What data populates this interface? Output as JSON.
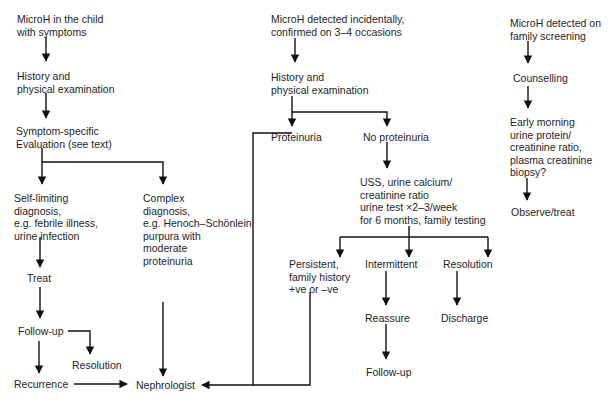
{
  "diagram": {
    "type": "flowchart",
    "columns": {
      "symptomatic": {
        "start": "MicroH in the child\nwith symptoms",
        "history": "History and\nphysical examination",
        "evaluation": "Symptom-specific\nEvaluation (see text)",
        "self_limiting": "Self-limiting\ndiagnosis,\ne.g. febrile illness,\nurine infection",
        "complex": "Complex\ndiagnosis,\ne.g. Henoch–Schönlein\npurpura with\nmoderate\nproteinuria",
        "treat": "Treat",
        "follow_up": "Follow-up",
        "resolution": "Resolution",
        "recurrence": "Recurrence"
      },
      "incidental": {
        "start": "MicroH detected incidentally,\nconfirmed on 3–4 occasions",
        "history": "History and\nphysical examination",
        "proteinuria": "Proteinuria",
        "no_proteinuria": "No proteinuria",
        "tests": "USS, urine calcium/\ncreatinine ratio\nurine test ×2–3/week\nfor 6 months, family testing",
        "persistent": "Persistent,\nfamily history\n+ve or –ve",
        "intermittent": "Intermittent",
        "resolution": "Resolution",
        "reassure": "Reassure",
        "discharge": "Discharge",
        "follow_up": "Follow-up"
      },
      "family": {
        "start": "MicroH detected on\nfamily screening",
        "counselling": "Counselling",
        "tests": "Early morning\nurine protein/\ncreatinine ratio,\nplasma creatinine\nbiopsy?",
        "observe": "Observe/treat"
      }
    },
    "endpoint": "Nephrologist",
    "edges": [
      [
        "symptomatic.start",
        "symptomatic.history"
      ],
      [
        "symptomatic.history",
        "symptomatic.evaluation"
      ],
      [
        "symptomatic.evaluation",
        "symptomatic.self_limiting"
      ],
      [
        "symptomatic.evaluation",
        "symptomatic.complex"
      ],
      [
        "symptomatic.self_limiting",
        "symptomatic.treat"
      ],
      [
        "symptomatic.treat",
        "symptomatic.follow_up"
      ],
      [
        "symptomatic.follow_up",
        "symptomatic.resolution"
      ],
      [
        "symptomatic.follow_up",
        "symptomatic.recurrence"
      ],
      [
        "symptomatic.recurrence",
        "endpoint"
      ],
      [
        "symptomatic.complex",
        "endpoint"
      ],
      [
        "incidental.start",
        "incidental.history"
      ],
      [
        "incidental.history",
        "incidental.proteinuria"
      ],
      [
        "incidental.history",
        "incidental.no_proteinuria"
      ],
      [
        "incidental.proteinuria",
        "endpoint"
      ],
      [
        "incidental.no_proteinuria",
        "incidental.tests"
      ],
      [
        "incidental.tests",
        "incidental.persistent"
      ],
      [
        "incidental.tests",
        "incidental.intermittent"
      ],
      [
        "incidental.tests",
        "incidental.resolution"
      ],
      [
        "incidental.persistent",
        "endpoint"
      ],
      [
        "incidental.intermittent",
        "incidental.reassure"
      ],
      [
        "incidental.reassure",
        "incidental.follow_up"
      ],
      [
        "incidental.resolution",
        "incidental.discharge"
      ],
      [
        "family.start",
        "family.counselling"
      ],
      [
        "family.counselling",
        "family.tests"
      ],
      [
        "family.tests",
        "family.observe"
      ]
    ]
  }
}
